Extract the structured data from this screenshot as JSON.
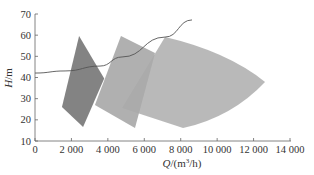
{
  "chart_data": {
    "type": "area",
    "title": "",
    "xlabel": "Q/(m³/h)",
    "ylabel": "H/m",
    "xlim": [
      0,
      14000
    ],
    "ylim": [
      10,
      70
    ],
    "grid": false,
    "x_ticks": [
      0,
      2000,
      4000,
      6000,
      8000,
      10000,
      12000,
      14000
    ],
    "x_tick_labels": [
      "0",
      "2 000",
      "4 000",
      "6 000",
      "8 000",
      "10 000",
      "12 000",
      "14 000"
    ],
    "y_ticks": [
      10,
      20,
      30,
      40,
      50,
      60,
      70
    ],
    "y_tick_labels": [
      "10",
      "20",
      "30",
      "40",
      "50",
      "60",
      "70"
    ],
    "regions": [
      {
        "name": "pump-region-1",
        "color": "#787878",
        "vertices": [
          [
            2420,
            59.6
          ],
          [
            3800,
            39.5
          ],
          [
            2640,
            16.6
          ],
          [
            1480,
            26.1
          ]
        ]
      },
      {
        "name": "pump-region-2",
        "color": "#a9a9a9",
        "vertices": [
          [
            4720,
            59.6
          ],
          [
            6590,
            51.6
          ],
          [
            5490,
            16.1
          ],
          [
            3290,
            27.0
          ]
        ]
      },
      {
        "name": "pump-region-3",
        "color": "#b5b5b5",
        "vertices": [
          [
            7140,
            59.1
          ],
          [
            12630,
            37.9
          ],
          [
            8130,
            16.1
          ],
          [
            4780,
            25.6
          ]
        ]
      }
    ],
    "series": [
      {
        "name": "system-curve",
        "type": "line",
        "color": "#555555",
        "x": [
          0,
          1650,
          3570,
          4780,
          7140,
          8620
        ],
        "y": [
          42.1,
          43.1,
          45.4,
          49.7,
          59.1,
          67.2
        ]
      }
    ]
  },
  "axes": {
    "xlabel_q": "Q",
    "xlabel_unit": "/(m",
    "xlabel_sup": "3",
    "xlabel_end": "/h)",
    "ylabel_h": "H",
    "ylabel_unit": "/m"
  }
}
